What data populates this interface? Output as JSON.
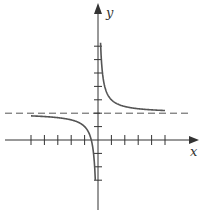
{
  "chart_data": {
    "type": "line",
    "title": "",
    "xlabel": "x",
    "ylabel": "y",
    "function": "y = 2 + 1/x",
    "xlim": [
      -5,
      5
    ],
    "ylim": [
      -3,
      7
    ],
    "x_ticks": [
      -5,
      -4,
      -3,
      -2,
      -1,
      1,
      2,
      3,
      4,
      5
    ],
    "y_ticks": [
      -3,
      -2,
      -1,
      1,
      2,
      3,
      4,
      5,
      6,
      7
    ],
    "tick_labels_shown": false,
    "grid": false,
    "asymptotes": {
      "horizontal": {
        "y": 2,
        "style": "dashed"
      },
      "vertical": {
        "x": 0
      }
    },
    "series": [
      {
        "name": "left-branch",
        "x": [
          -5,
          -4,
          -3,
          -2,
          -1,
          -0.5,
          -0.3,
          -0.2
        ],
        "y": [
          1.8,
          1.75,
          1.67,
          1.5,
          1.0,
          0.0,
          -1.33,
          -3.0
        ]
      },
      {
        "name": "right-branch",
        "x": [
          0.19,
          0.25,
          0.5,
          1,
          2,
          3,
          4,
          5
        ],
        "y": [
          7.2,
          6.0,
          4.0,
          3.0,
          2.5,
          2.33,
          2.25,
          2.2
        ]
      }
    ],
    "colors": {
      "curve": "#555555",
      "axes": "#333333",
      "asymptote": "#555555"
    }
  },
  "labels": {
    "x": "x",
    "y": "y"
  }
}
